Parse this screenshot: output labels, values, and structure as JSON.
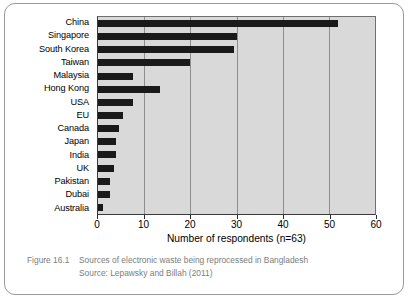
{
  "figure": {
    "number_label": "Figure 16.1",
    "title": "Sources of electronic waste being reprocessed in Bangladesh",
    "source": "Source: Lepawsky and Billah (2011)"
  },
  "colors": {
    "bar": "#1a1a1a",
    "plot_background": "#d9d9d9",
    "gridline": "#8e8e8e",
    "axis": "#2b2b2b",
    "caption_text": "#7c7c7c",
    "frame_border": "#9a9a9a"
  },
  "chart_data": {
    "type": "bar",
    "orientation": "horizontal",
    "title": "",
    "xlabel": "Number of respondents (n=63)",
    "ylabel": "",
    "xlim": [
      0,
      60
    ],
    "xticks": [
      0,
      10,
      20,
      30,
      40,
      50,
      60
    ],
    "xtick_labels": [
      "0",
      "10",
      "20",
      "30",
      "40",
      "50",
      "60"
    ],
    "grid": true,
    "legend": false,
    "categories": [
      "China",
      "Singapore",
      "South Korea",
      "Taiwan",
      "Malaysia",
      "Hong Kong",
      "USA",
      "EU",
      "Canada",
      "Japan",
      "India",
      "UK",
      "Pakistan",
      "Dubai",
      "Australia"
    ],
    "values": [
      52,
      30,
      29.5,
      20,
      7.5,
      13.5,
      7.5,
      5.5,
      4.5,
      4,
      4,
      3.5,
      2.5,
      2.5,
      1
    ]
  }
}
